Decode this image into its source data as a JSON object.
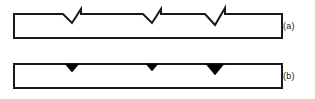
{
  "figure": {
    "type": "technical-line-diagram",
    "background_color": "#ffffff",
    "stroke_color": "#1a1a1a",
    "fill_color": "#000000",
    "panels": [
      {
        "id": "a",
        "label": "(a)",
        "feature_name": "v-shaped-cracks",
        "feature_fill": "none",
        "bar": {
          "x": 14,
          "y": 14,
          "width": 268,
          "height": 24
        },
        "features": [
          {
            "index": 1,
            "center_x": 72,
            "half_width": 9,
            "depth": 9,
            "tick_height": 5
          },
          {
            "index": 2,
            "center_x": 152,
            "half_width": 9,
            "depth": 9,
            "tick_height": 5
          },
          {
            "index": 3,
            "center_x": 215,
            "half_width": 10,
            "depth": 11,
            "tick_height": 6
          }
        ]
      },
      {
        "id": "b",
        "label": "(b)",
        "feature_name": "filled-triangular-notches",
        "feature_fill": "#000000",
        "bar": {
          "x": 14,
          "y": 14,
          "width": 268,
          "height": 24
        },
        "features": [
          {
            "index": 1,
            "center_x": 72,
            "half_width": 7,
            "depth": 8
          },
          {
            "index": 2,
            "center_x": 152,
            "half_width": 6,
            "depth": 7
          },
          {
            "index": 3,
            "center_x": 215,
            "half_width": 9,
            "depth": 11
          }
        ]
      }
    ]
  },
  "labels": {
    "panel_a": "(a)",
    "panel_b": "(b)"
  }
}
